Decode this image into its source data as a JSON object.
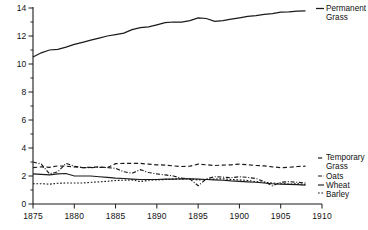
{
  "chart_data": {
    "type": "line",
    "title": "",
    "subtitle": "",
    "xlabel": "",
    "ylabel": "MILLION ACRES",
    "xlim": [
      1875,
      1910
    ],
    "ylim": [
      0,
      14
    ],
    "grid": false,
    "legend_position": "right-inline",
    "x_ticks": [
      "1875",
      "1880",
      "1885",
      "1890",
      "1895",
      "1900",
      "1905",
      "1910"
    ],
    "x_tick_values": [
      1875,
      1880,
      1885,
      1890,
      1895,
      1900,
      1905,
      1910
    ],
    "y_ticks": [
      "0",
      "2",
      "4",
      "6",
      "8",
      "10",
      "12",
      "14"
    ],
    "y_tick_values": [
      0,
      2,
      4,
      6,
      8,
      10,
      12,
      14
    ],
    "y_minor_tick_values": [
      1,
      3,
      5,
      7,
      9,
      11,
      13
    ],
    "x": [
      1875,
      1876,
      1877,
      1878,
      1879,
      1880,
      1881,
      1882,
      1883,
      1884,
      1885,
      1886,
      1887,
      1888,
      1889,
      1890,
      1891,
      1892,
      1893,
      1894,
      1895,
      1896,
      1897,
      1898,
      1899,
      1900,
      1901,
      1902,
      1903,
      1904,
      1905,
      1906,
      1907,
      1908
    ],
    "series": [
      {
        "name": "Permanent Grass",
        "style": "solid",
        "color": "#1a1a1a",
        "label_x": 1910.2,
        "label_y": 13.85,
        "values": [
          10.5,
          10.8,
          11.0,
          11.05,
          11.2,
          11.4,
          11.55,
          11.7,
          11.85,
          12.0,
          12.1,
          12.2,
          12.45,
          12.6,
          12.65,
          12.8,
          12.95,
          13.0,
          13.0,
          13.1,
          13.3,
          13.25,
          13.05,
          13.1,
          13.2,
          13.3,
          13.4,
          13.45,
          13.55,
          13.6,
          13.7,
          13.72,
          13.78,
          13.8
        ]
      },
      {
        "name": "Temporary Grass",
        "style": "dashed",
        "color": "#1a1a1a",
        "label_x": 1910.2,
        "label_y": 3.0,
        "values": [
          2.6,
          2.65,
          2.62,
          2.72,
          2.7,
          2.65,
          2.6,
          2.62,
          2.65,
          2.6,
          2.88,
          2.9,
          2.9,
          2.9,
          2.85,
          2.8,
          2.78,
          2.72,
          2.68,
          2.7,
          2.85,
          2.8,
          2.75,
          2.78,
          2.8,
          2.85,
          2.8,
          2.75,
          2.72,
          2.65,
          2.6,
          2.62,
          2.68,
          2.7
        ]
      },
      {
        "name": "Oats",
        "style": "dashdot",
        "color": "#1a1a1a",
        "label_x": 1910.2,
        "label_y": 2.15,
        "values": [
          3.0,
          2.85,
          2.15,
          2.3,
          2.9,
          2.7,
          2.6,
          2.6,
          2.62,
          2.6,
          2.55,
          2.3,
          2.2,
          2.45,
          2.25,
          2.15,
          2.08,
          2.0,
          1.85,
          1.8,
          1.3,
          1.8,
          1.95,
          1.92,
          1.88,
          1.95,
          1.9,
          1.82,
          1.6,
          1.3,
          1.55,
          1.6,
          1.55,
          1.5
        ]
      },
      {
        "name": "Wheat",
        "style": "solid-thin",
        "color": "#1a1a1a",
        "label_x": 1910.2,
        "label_y": 1.7,
        "values": [
          2.15,
          2.12,
          2.08,
          2.15,
          2.18,
          2.0,
          2.0,
          2.0,
          1.95,
          1.9,
          1.85,
          1.82,
          1.78,
          1.75,
          1.75,
          1.75,
          1.78,
          1.78,
          1.8,
          1.8,
          1.78,
          1.75,
          1.72,
          1.7,
          1.65,
          1.62,
          1.58,
          1.55,
          1.5,
          1.45,
          1.42,
          1.4,
          1.38,
          1.35
        ]
      },
      {
        "name": "Barley",
        "style": "dotted",
        "color": "#1a1a1a",
        "label_x": 1910.2,
        "label_y": 1.25,
        "values": [
          1.45,
          1.45,
          1.42,
          1.48,
          1.5,
          1.5,
          1.5,
          1.55,
          1.58,
          1.62,
          1.68,
          1.7,
          1.72,
          1.6,
          1.7,
          1.72,
          1.75,
          1.78,
          1.78,
          1.8,
          1.72,
          1.75,
          1.78,
          1.8,
          1.75,
          1.72,
          1.68,
          1.6,
          1.55,
          1.5,
          1.45,
          1.42,
          1.45,
          1.4
        ]
      }
    ]
  },
  "legend": {
    "entries": [
      {
        "label": "Permanent"
      },
      {
        "label": "Grass"
      },
      {
        "label": "Temporary"
      },
      {
        "label": "Grass"
      },
      {
        "label": "Oats"
      },
      {
        "label": "Wheat"
      },
      {
        "label": "Barley"
      }
    ],
    "permanent_grass_line1": "Permanent",
    "permanent_grass_line2": "Grass",
    "temporary_grass_line1": "Temporary",
    "temporary_grass_line2": "Grass",
    "oats": "Oats",
    "wheat": "Wheat",
    "barley": "Barley"
  },
  "axes": {
    "y_axis_title": "MILLION ACRES",
    "x_tick_labels": [
      "1875",
      "1880",
      "1885",
      "1890",
      "1895",
      "1900",
      "1905",
      "1910"
    ],
    "y_tick_labels": [
      "0",
      "2",
      "4",
      "6",
      "8",
      "10",
      "12",
      "14"
    ]
  },
  "colors": {
    "ink": "#1a1a1a",
    "background": "#ffffff"
  }
}
